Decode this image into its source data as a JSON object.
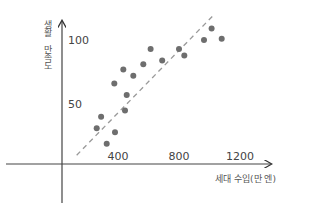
{
  "chart_data": {
    "type": "scatter",
    "title": "",
    "xlabel": "세대 수입(만 엔)",
    "ylabel": "생활 만족도",
    "x_ticks": [
      400,
      800,
      1200
    ],
    "y_ticks": [
      50,
      100
    ],
    "xlim": [
      0,
      1400
    ],
    "ylim": [
      0,
      120
    ],
    "grid": false,
    "legend": null,
    "series": [
      {
        "name": "households",
        "color": "#6e6e6e",
        "points": [
          {
            "x": 326,
            "y": 19
          },
          {
            "x": 260,
            "y": 31
          },
          {
            "x": 380,
            "y": 28
          },
          {
            "x": 289,
            "y": 40
          },
          {
            "x": 446,
            "y": 45
          },
          {
            "x": 457,
            "y": 57
          },
          {
            "x": 376,
            "y": 66
          },
          {
            "x": 435,
            "y": 77
          },
          {
            "x": 500,
            "y": 72
          },
          {
            "x": 566,
            "y": 81
          },
          {
            "x": 614,
            "y": 93
          },
          {
            "x": 690,
            "y": 84
          },
          {
            "x": 800,
            "y": 93
          },
          {
            "x": 835,
            "y": 88
          },
          {
            "x": 964,
            "y": 100
          },
          {
            "x": 1014,
            "y": 109
          },
          {
            "x": 1080,
            "y": 101
          }
        ]
      }
    ],
    "trend_line": {
      "style": "dashed",
      "color": "#9a9a9a",
      "from": {
        "x": 129,
        "y": 10
      },
      "to": {
        "x": 1023,
        "y": 119
      }
    }
  },
  "axes": {
    "x_label": "세대 수입(만 엔)",
    "y_label": "생활 만족도",
    "x_tick_labels": [
      "400",
      "800",
      "1200"
    ],
    "y_tick_labels": [
      "50",
      "100"
    ]
  }
}
